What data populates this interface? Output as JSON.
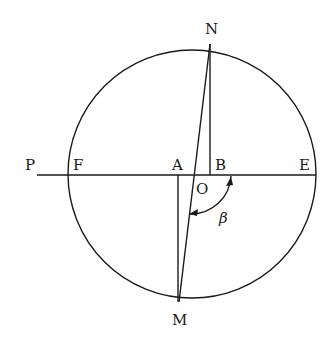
{
  "figure": {
    "type": "geometry-diagram",
    "colors": {
      "ink": "#1a1a1a",
      "background": "#ffffff"
    }
  },
  "circle": {
    "cx": 192,
    "cy": 174,
    "r": 124
  },
  "labels": {
    "N": "N",
    "M": "M",
    "P": "P",
    "F": "F",
    "A": "A",
    "B": "B",
    "E": "E",
    "O": "O",
    "beta": "β"
  },
  "points": {
    "N": [
      210,
      43
    ],
    "M": [
      179,
      303
    ],
    "P": [
      37,
      175
    ],
    "F": [
      68,
      175
    ],
    "A": [
      178,
      175
    ],
    "B": [
      211,
      175
    ],
    "E": [
      316,
      175
    ],
    "O": [
      194,
      175
    ]
  },
  "angle": {
    "name": "beta",
    "symbol": "β",
    "from": "OB direction",
    "to": "OM direction",
    "arrows": "both ends"
  }
}
